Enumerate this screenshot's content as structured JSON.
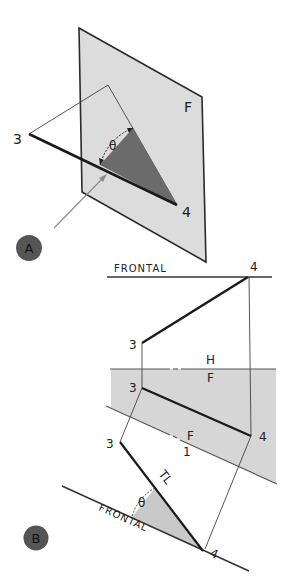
{
  "colors": {
    "plane_fill": "#dcdcdc",
    "plane_stroke": "#2a2a2a",
    "angle_triangle_dark": "#6b6b6b",
    "angle_triangle_light": "#c9c9c9",
    "fold_region_fill": "#d6d6d6",
    "badge_fill": "#555555",
    "line_dark": "#1a1a1a",
    "line_thin": "#444444",
    "arrow": "#8a8a8a"
  },
  "view_a": {
    "badge": "A",
    "plane_label": "F",
    "point_3_label": "3",
    "point_4_label": "4",
    "angle_symbol": "θ"
  },
  "view_b": {
    "badge": "B",
    "frontal_view": {
      "frontal_line_label": "FRONTAL",
      "point_4_label": "4",
      "point_3_label": "3"
    },
    "fold_line_hf": {
      "upper_label": "H",
      "lower_label": "F"
    },
    "horizontal_view": {
      "point_3_label": "3",
      "point_4_label": "4"
    },
    "fold_line_f1": {
      "upper_label": "F",
      "lower_label": "1"
    },
    "auxiliary_view": {
      "point_3_label": "3",
      "point_4_label": "4",
      "true_length_label": "TL",
      "angle_symbol": "θ",
      "frontal_line_label": "FRONTAL"
    }
  }
}
